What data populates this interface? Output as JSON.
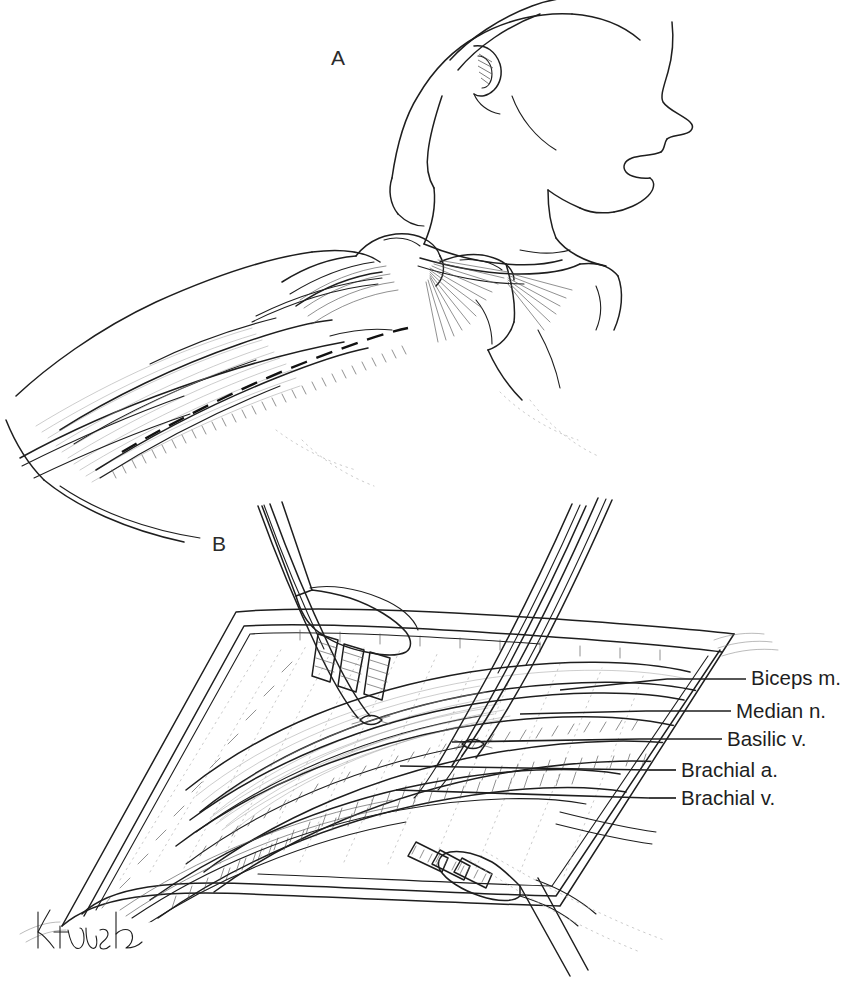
{
  "figure": {
    "type": "anatomical-line-drawing",
    "background_color": "#ffffff",
    "ink_color": "#1e1e1e",
    "width": 857,
    "height": 994
  },
  "panels": [
    {
      "id": "A",
      "letter": "A",
      "caption": "",
      "description": "Lateral view of head, neck, shoulder and upper arm showing the dashed medial incision line over the biceps/brachial groove"
    },
    {
      "id": "B",
      "letter": "B",
      "caption": "",
      "description": "Open surgical field of the medial upper arm with rake retractors, vessel loops and exposed neurovascular structures"
    }
  ],
  "callouts": [
    {
      "id": "biceps-m",
      "label": "Biceps m.",
      "leader_y": 679,
      "leader_x1": 667,
      "leader_x2": 746
    },
    {
      "id": "median-n",
      "label": "Median n.",
      "leader_y": 711,
      "leader_x1": 646,
      "leader_x2": 731
    },
    {
      "id": "basilic-v",
      "label": "Basilic v.",
      "leader_y": 739,
      "leader_x1": 640,
      "leader_x2": 722
    },
    {
      "id": "brachial-a",
      "label": "Brachial a.",
      "leader_y": 770,
      "leader_x1": 649,
      "leader_x2": 676
    },
    {
      "id": "brachial-v",
      "label": "Brachial v.",
      "leader_y": 798,
      "leader_x1": 649,
      "leader_x2": 676
    }
  ],
  "signature": {
    "text": "K. Hush",
    "style": "cursive-handwritten-artist-signature",
    "x": 38,
    "y": 930
  }
}
